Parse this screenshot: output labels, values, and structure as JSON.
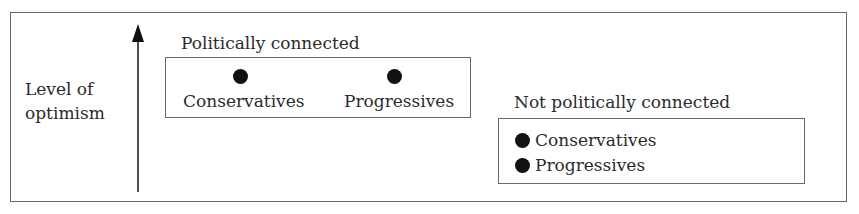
{
  "diagram": {
    "y_axis": {
      "label_line1": "Level of",
      "label_line2": "optimism",
      "direction": "up"
    },
    "groups": [
      {
        "title": "Politically connected",
        "items": [
          {
            "label": "Conservatives",
            "marker": "filled-circle"
          },
          {
            "label": "Progressives",
            "marker": "filled-circle"
          }
        ],
        "relative_level": "high"
      },
      {
        "title": "Not politically connected",
        "items": [
          {
            "label": "Conservatives",
            "marker": "filled-circle"
          },
          {
            "label": "Progressives",
            "marker": "filled-circle"
          }
        ],
        "relative_level": "low"
      }
    ],
    "colors": {
      "border": "#6a6a6a",
      "marker": "#111111",
      "text": "#2b2b2b"
    }
  }
}
